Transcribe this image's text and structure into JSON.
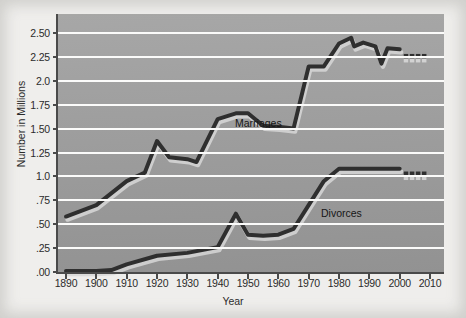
{
  "chart_data": {
    "type": "line",
    "title": "",
    "xlabel": "Year",
    "ylabel": "Number in Millions",
    "xlim": [
      1890,
      2010
    ],
    "ylim": [
      0.0,
      2.5
    ],
    "grid": true,
    "legend_position": "inline-annotations",
    "x_ticks": [
      1890,
      1900,
      1910,
      1920,
      1930,
      1940,
      1950,
      1960,
      1970,
      1980,
      1990,
      2000,
      2010
    ],
    "x_tick_labels": [
      "1890",
      "1900",
      "1910",
      "1920",
      "1930",
      "1940",
      "1950",
      "1960",
      "1970",
      "1980",
      "1990",
      "2000",
      "2010"
    ],
    "y_ticks": [
      0.0,
      0.25,
      0.5,
      0.75,
      1.0,
      1.25,
      1.5,
      1.75,
      2.0,
      2.25,
      2.5
    ],
    "y_tick_labels": [
      ".00",
      ".25",
      ".50",
      ".75",
      "1.0",
      "1.25",
      "1.50",
      "1.75",
      "2.0",
      "2.25",
      "2.50"
    ],
    "annotations": [
      {
        "text": "Marriages",
        "x": 1945,
        "y": 1.82
      },
      {
        "text": "Divorces",
        "x": 1972,
        "y": 0.86
      }
    ],
    "series": [
      {
        "name": "Marriages",
        "color": "#2f2f2f",
        "points": [
          [
            1890,
            0.58
          ],
          [
            1900,
            0.7
          ],
          [
            1910,
            0.95
          ],
          [
            1916,
            1.04
          ],
          [
            1920,
            1.37
          ],
          [
            1924,
            1.2
          ],
          [
            1930,
            1.18
          ],
          [
            1933,
            1.15
          ],
          [
            1940,
            1.6
          ],
          [
            1946,
            1.66
          ],
          [
            1950,
            1.66
          ],
          [
            1955,
            1.53
          ],
          [
            1960,
            1.52
          ],
          [
            1965,
            1.5
          ],
          [
            1970,
            2.15
          ],
          [
            1975,
            2.15
          ],
          [
            1980,
            2.39
          ],
          [
            1984,
            2.45
          ],
          [
            1985,
            2.36
          ],
          [
            1988,
            2.4
          ],
          [
            1992,
            2.36
          ],
          [
            1994,
            2.18
          ],
          [
            1996,
            2.34
          ],
          [
            2000,
            2.33
          ]
        ],
        "projected_points": [
          [
            2002,
            2.26
          ],
          [
            2004,
            2.26
          ],
          [
            2006,
            2.26
          ],
          [
            2008,
            2.26
          ]
        ]
      },
      {
        "name": "Divorces",
        "color": "#2f2f2f",
        "points": [
          [
            1890,
            0.01
          ],
          [
            1900,
            0.01
          ],
          [
            1905,
            0.02
          ],
          [
            1910,
            0.08
          ],
          [
            1920,
            0.17
          ],
          [
            1930,
            0.2
          ],
          [
            1940,
            0.26
          ],
          [
            1946,
            0.61
          ],
          [
            1950,
            0.39
          ],
          [
            1955,
            0.38
          ],
          [
            1960,
            0.39
          ],
          [
            1965,
            0.45
          ],
          [
            1970,
            0.7
          ],
          [
            1975,
            0.95
          ],
          [
            1980,
            1.08
          ],
          [
            1990,
            1.08
          ],
          [
            2000,
            1.08
          ]
        ],
        "projected_points": [
          [
            2002,
            1.03
          ],
          [
            2004,
            1.03
          ],
          [
            2006,
            1.03
          ],
          [
            2008,
            1.03
          ]
        ]
      }
    ]
  }
}
